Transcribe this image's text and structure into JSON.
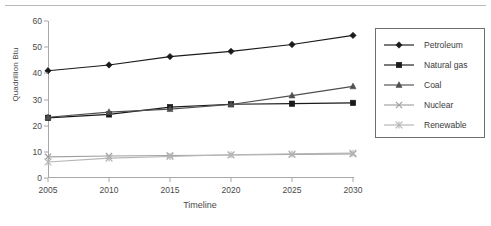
{
  "chart_data": {
    "type": "line",
    "title": "",
    "xlabel": "Timeline",
    "ylabel": "Quadrillion Btu",
    "categories": [
      "2005",
      "2010",
      "2015",
      "2020",
      "2025",
      "2030"
    ],
    "x": [
      2005,
      2010,
      2015,
      2020,
      2025,
      2030
    ],
    "xlim": [
      2005,
      2030
    ],
    "ylim": [
      0,
      60
    ],
    "yticks": [
      0,
      10,
      20,
      30,
      40,
      50,
      60
    ],
    "xticks": [
      "2005",
      "2010",
      "2015",
      "2020",
      "2025",
      "2030"
    ],
    "grid": false,
    "legend_position": "right",
    "series": [
      {
        "name": "Petroleum",
        "marker": "diamond",
        "color": "#1a1a1a",
        "values": [
          41.0,
          43.2,
          46.4,
          48.4,
          51.0,
          54.5
        ]
      },
      {
        "name": "Natural gas",
        "marker": "square",
        "color": "#1a1a1a",
        "values": [
          23.0,
          24.3,
          27.1,
          28.2,
          28.4,
          28.7
        ]
      },
      {
        "name": "Coal",
        "marker": "triangle",
        "color": "#4f4f4f",
        "values": [
          23.2,
          25.2,
          26.3,
          28.1,
          31.5,
          35.0
        ]
      },
      {
        "name": "Nuclear",
        "marker": "cross",
        "color": "#a0a0a0",
        "values": [
          8.1,
          8.4,
          8.6,
          8.8,
          9.0,
          9.2
        ]
      },
      {
        "name": "Renewable",
        "marker": "asterisk",
        "color": "#b5b5b5",
        "values": [
          6.1,
          7.6,
          8.2,
          8.9,
          9.2,
          9.5
        ]
      }
    ]
  },
  "legend": {
    "items": [
      {
        "label": "Petroleum"
      },
      {
        "label": "Natural gas"
      },
      {
        "label": "Coal"
      },
      {
        "label": "Nuclear"
      },
      {
        "label": "Renewable"
      }
    ]
  }
}
